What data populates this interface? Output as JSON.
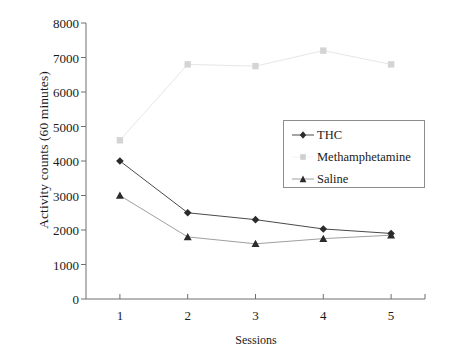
{
  "chart_data": {
    "type": "line",
    "title": "",
    "xlabel": "Sessions",
    "ylabel": "Activity counts (60 minutes)",
    "categories": [
      "1",
      "2",
      "3",
      "4",
      "5"
    ],
    "x": [
      1,
      2,
      3,
      4,
      5
    ],
    "xlim": [
      0.5,
      5.5
    ],
    "ylim": [
      0,
      8000
    ],
    "yticks": [
      "0",
      "1000",
      "2000",
      "3000",
      "4000",
      "5000",
      "6000",
      "7000",
      "8000"
    ],
    "ytick_values": [
      0,
      1000,
      2000,
      3000,
      4000,
      5000,
      6000,
      7000,
      8000
    ],
    "grid": false,
    "legend_position": "center-right",
    "series": [
      {
        "name": "THC",
        "marker": "diamond",
        "color": "#2b2b2b",
        "line_color": "#4a4a4a",
        "values": [
          4000,
          2500,
          2300,
          2030,
          1900
        ]
      },
      {
        "name": "Methamphetamine",
        "marker": "square",
        "color": "#d4d4d4",
        "line_color": "#e6e6e6",
        "values": [
          4600,
          6800,
          6750,
          7200,
          6800
        ]
      },
      {
        "name": "Saline",
        "marker": "triangle",
        "color": "#2b2b2b",
        "line_color": "#a0a0a0",
        "values": [
          3000,
          1800,
          1600,
          1750,
          1850
        ]
      }
    ]
  },
  "legend": {
    "items": [
      {
        "label": "THC"
      },
      {
        "label": "Methamphetamine"
      },
      {
        "label": "Saline"
      }
    ]
  },
  "axes": {
    "axis_color": "#6f6f6f"
  }
}
